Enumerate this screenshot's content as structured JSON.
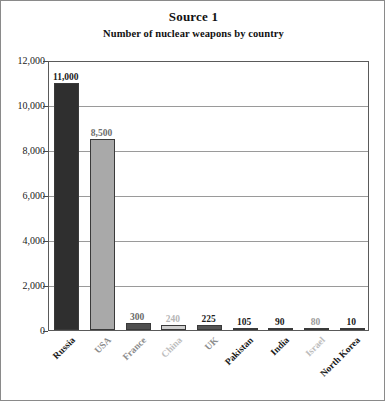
{
  "figure": {
    "title": "Source 1",
    "subtitle": "Number of nuclear weapons by country"
  },
  "chart_data": {
    "type": "bar",
    "title": "Source 1",
    "subtitle": "Number of nuclear weapons by country",
    "xlabel": "",
    "ylabel": "",
    "ylim": [
      0,
      12000
    ],
    "grid": true,
    "legend": false,
    "categories": [
      "Russia",
      "USA",
      "France",
      "China",
      "UK",
      "Pakistan",
      "India",
      "Israel",
      "North Korea"
    ],
    "values": [
      11000,
      8500,
      300,
      240,
      225,
      105,
      90,
      80,
      10
    ],
    "value_labels": [
      "11,000",
      "8,500",
      "300",
      "240",
      "225",
      "105",
      "90",
      "80",
      "10"
    ],
    "ytick_labels": [
      "0",
      "2,000",
      "4,000",
      "6,000",
      "8,000",
      "10,000",
      "12,000"
    ],
    "ytick_values": [
      0,
      2000,
      4000,
      6000,
      8000,
      10000,
      12000
    ],
    "bar_colors": [
      "#2f2f2f",
      "#a9a9a9",
      "#4f4f4f",
      "#cfcfcf",
      "#545454",
      "#2f2f2f",
      "#3b3b3b",
      "#8f8f8f",
      "#2f2f2f"
    ],
    "label_colors": [
      "#1a1a1a",
      "#6e6e6e",
      "#6a6a6a",
      "#b6b6b6",
      "#1f1f1f",
      "#1a1a1a",
      "#1a1a1a",
      "#9a9a9a",
      "#1a1a1a"
    ],
    "category_label_colors": [
      "#1a1a1a",
      "#8b8b8b",
      "#8b8b8b",
      "#bdbdbd",
      "#8b8b8b",
      "#1a1a1a",
      "#1a1a1a",
      "#bdbdbd",
      "#1a1a1a"
    ]
  },
  "colors": {
    "frame": "#8a8a8a",
    "axis": "#5a5a5a",
    "gridline": "#9a9a9a",
    "text": "#111111",
    "background": "#ffffff"
  }
}
